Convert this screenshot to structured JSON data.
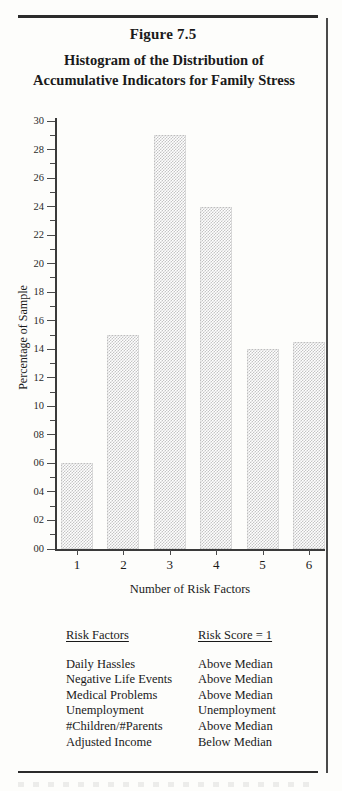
{
  "figure": {
    "number": "Figure 7.5",
    "title_line1": "Histogram of the Distribution of",
    "title_line2": "Accumulative Indicators for Family Stress"
  },
  "chart_data": {
    "type": "bar",
    "title": "Histogram of the Distribution of Accumulative Indicators for Family Stress",
    "categories": [
      "1",
      "2",
      "3",
      "4",
      "5",
      "6"
    ],
    "values": [
      6.0,
      15.0,
      29.0,
      24.0,
      14.0,
      14.5
    ],
    "xlabel": "Number of Risk Factors",
    "ylabel": "Percentage of Sample",
    "ylim": [
      0,
      30
    ],
    "ytick_step": 2,
    "yticks": [
      "00",
      "02",
      "04",
      "06",
      "08",
      "10",
      "12",
      "14",
      "16",
      "18",
      "20",
      "22",
      "24",
      "26",
      "28",
      "30"
    ],
    "minor_ticks": true,
    "grid": false,
    "legend": "none",
    "bar_fill": "#c4c4c4",
    "axis_color": "#3a3a3a"
  },
  "table": {
    "header": {
      "risk_factors": "Risk Factors",
      "risk_score": "Risk Score = 1"
    },
    "rows": [
      {
        "factor": "Daily Hassles",
        "score": "Above Median"
      },
      {
        "factor": "Negative Life Events",
        "score": "Above Median"
      },
      {
        "factor": "Medical Problems",
        "score": "Above Median"
      },
      {
        "factor": "Unemployment",
        "score": "Unemployment"
      },
      {
        "factor": "#Children/#Parents",
        "score": "Above Median"
      },
      {
        "factor": "Adjusted Income",
        "score": "Below Median"
      }
    ]
  }
}
